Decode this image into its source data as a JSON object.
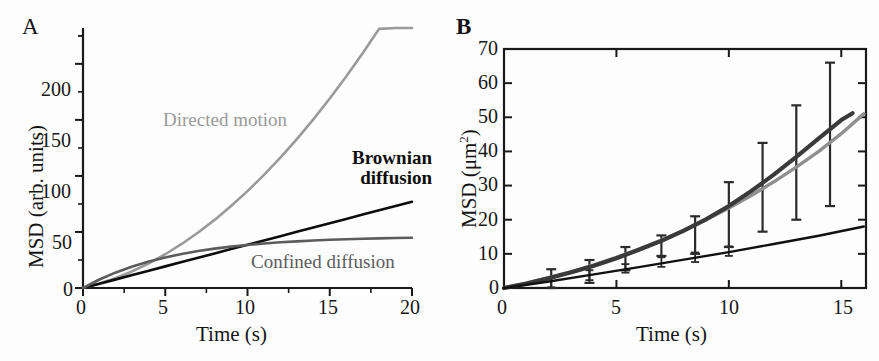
{
  "figure": {
    "width": 879,
    "height": 361,
    "background": "#fdfdfd"
  },
  "colors": {
    "axis": "#1a1a1a",
    "directed_motion": "#9a9a9a",
    "brownian_diffusion": "#0d0d0d",
    "confined_diffusion": "#5c5c5c",
    "panel_b_data": "#3a3a3a",
    "panel_b_fit": "#8f8f8f",
    "panel_b_lower": "#111111",
    "errorbar": "#2b2b2b"
  },
  "panel_a": {
    "letter": "A",
    "xlabel": "Time (s)",
    "ylabel": "MSD (arb. units)",
    "xticks": [
      0,
      5,
      10,
      15,
      20
    ],
    "xtick_labels": [
      "0",
      "5",
      "10",
      "15",
      "20"
    ],
    "yticks": [
      0,
      50,
      100,
      150,
      200
    ],
    "ytick_labels": [
      "0",
      "50",
      "100",
      "150",
      "200"
    ],
    "xlim": [
      0,
      20
    ],
    "ylim": [
      0,
      232
    ],
    "labels": {
      "directed": "Directed motion",
      "brownian_line1": "Brownian",
      "brownian_line2": "diffusion",
      "confined": "Confined diffusion"
    }
  },
  "panel_b": {
    "letter": "B",
    "xlabel": "Time (s)",
    "ylabel_main": "MSD (",
    "ylabel_unit": "μm",
    "ylabel_sup": "2",
    "ylabel_close": ")",
    "xticks": [
      0,
      5,
      10,
      15
    ],
    "xtick_labels": [
      "0",
      "5",
      "10",
      "15"
    ],
    "yticks": [
      0,
      10,
      20,
      30,
      40,
      50,
      60,
      70
    ],
    "ytick_labels": [
      "0",
      "10",
      "20",
      "30",
      "40",
      "50",
      "60",
      "70"
    ],
    "xlim": [
      0,
      16.1
    ],
    "ylim": [
      0,
      70
    ]
  },
  "chart_data": [
    {
      "type": "line",
      "panel": "A",
      "title": "",
      "xlabel": "Time (s)",
      "ylabel": "MSD (arb. units)",
      "xlim": [
        0,
        20
      ],
      "ylim": [
        0,
        232
      ],
      "grid": false,
      "legend": "inline-annotations",
      "x": [
        0,
        1,
        2,
        3,
        4,
        5,
        6,
        7,
        8,
        9,
        10,
        11,
        12,
        13,
        14,
        15,
        16,
        17,
        18,
        19,
        20
      ],
      "series": [
        {
          "name": "Directed motion",
          "color": "#9a9a9a",
          "model": "MSD = 4Dt + (vt)^2, D=0.85, v=3.1",
          "values": [
            0,
            3.8,
            9.0,
            15.7,
            23.8,
            33.4,
            44.3,
            56.7,
            70.6,
            85.9,
            102.6,
            120.8,
            140.4,
            161.5,
            184.0,
            208.0,
            233.4,
            260.3,
            288.6,
            318.4,
            219.0
          ]
        },
        {
          "name": "Brownian diffusion",
          "color": "#0d0d0d",
          "model": "MSD = 4Dt, D = 0.96",
          "values": [
            0,
            3.85,
            7.7,
            11.6,
            15.4,
            19.3,
            23.1,
            27.0,
            30.8,
            34.7,
            38.5,
            42.4,
            46.2,
            50.1,
            53.9,
            57.8,
            61.6,
            65.5,
            69.3,
            73.2,
            77.0
          ]
        },
        {
          "name": "Confined diffusion",
          "color": "#5c5c5c",
          "model": "MSD = L^2/3 * (1 - exp(-t/tau)), L^2/3 = 46, tau = 5.6",
          "values": [
            0,
            7.6,
            13.9,
            19.2,
            23.6,
            27.3,
            30.4,
            33.0,
            35.1,
            36.9,
            38.4,
            39.7,
            40.8,
            41.6,
            42.4,
            43.0,
            43.5,
            44.0,
            44.3,
            44.6,
            44.9
          ]
        }
      ]
    },
    {
      "type": "line",
      "panel": "B",
      "title": "",
      "xlabel": "Time (s)",
      "ylabel": "MSD (μm^2)",
      "xlim": [
        0,
        16.1
      ],
      "ylim": [
        0,
        70
      ],
      "grid": false,
      "series": [
        {
          "name": "Measured MSD (dark)",
          "color": "#3a3a3a",
          "x": [
            0,
            1,
            2,
            3,
            4,
            5,
            6,
            7,
            8,
            9,
            10,
            11,
            12,
            13,
            14,
            15,
            15.5
          ],
          "values": [
            0,
            1.3,
            2.9,
            4.6,
            6.5,
            8.7,
            11.2,
            13.8,
            16.8,
            20.2,
            24.0,
            28.4,
            33.2,
            38.4,
            43.8,
            49.2,
            51.2
          ]
        },
        {
          "name": "Fit (light gray)",
          "color": "#8f8f8f",
          "x": [
            0,
            1,
            2,
            3,
            4,
            5,
            6,
            7,
            8,
            9,
            10,
            11,
            12,
            13,
            14,
            15,
            16
          ],
          "values": [
            0,
            1.4,
            3.0,
            4.8,
            6.8,
            9.0,
            11.4,
            14.0,
            16.9,
            20.0,
            23.4,
            27.1,
            31.1,
            35.4,
            40.0,
            45.2,
            51.0
          ]
        },
        {
          "name": "Lower linear trace (black)",
          "color": "#111111",
          "x": [
            0,
            2,
            4,
            6,
            8,
            10,
            12,
            14,
            16
          ],
          "values": [
            0,
            1.9,
            4.0,
            6.1,
            8.3,
            10.5,
            12.9,
            15.3,
            18.0
          ]
        }
      ],
      "errorbars_upper": [
        {
          "x": 2.1,
          "y": 2.3,
          "lo": -1.1,
          "hi": 5.5
        },
        {
          "x": 3.8,
          "y": 5.0,
          "lo": 1.5,
          "hi": 8.2
        },
        {
          "x": 5.4,
          "y": 9.2,
          "lo": 5.2,
          "hi": 12.0
        },
        {
          "x": 7.0,
          "y": 13.0,
          "lo": 9.4,
          "hi": 15.4
        },
        {
          "x": 8.5,
          "y": 16.8,
          "lo": 10.0,
          "hi": 21.0
        },
        {
          "x": 10.0,
          "y": 23.5,
          "lo": 12.0,
          "hi": 31.0
        },
        {
          "x": 11.5,
          "y": 31.0,
          "lo": 16.5,
          "hi": 42.5
        },
        {
          "x": 13.0,
          "y": 38.5,
          "lo": 20.0,
          "hi": 53.5
        },
        {
          "x": 14.5,
          "y": 45.0,
          "lo": 24.0,
          "hi": 66.0
        }
      ],
      "errorbars_lower": [
        {
          "x": 2.1,
          "y": 2.0,
          "lo": 0.2,
          "hi": 3.0
        },
        {
          "x": 3.8,
          "y": 4.0,
          "lo": 2.3,
          "hi": 5.2
        },
        {
          "x": 5.4,
          "y": 5.8,
          "lo": 4.5,
          "hi": 7.0
        },
        {
          "x": 7.0,
          "y": 7.5,
          "lo": 6.2,
          "hi": 9.0
        },
        {
          "x": 8.5,
          "y": 9.0,
          "lo": 7.6,
          "hi": 10.4
        },
        {
          "x": 10.0,
          "y": 10.8,
          "lo": 9.4,
          "hi": 12.2
        }
      ]
    }
  ]
}
